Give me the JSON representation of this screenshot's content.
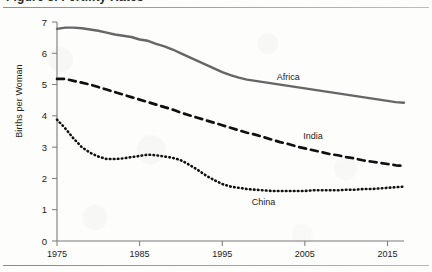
{
  "header": {
    "title_sliver": "Figure 3. Fertility Rates",
    "top_rule": "horizontal-rule",
    "bottom_rule": "horizontal-rule"
  },
  "chart_data": {
    "type": "line",
    "title": "",
    "xlabel": "",
    "ylabel": "Births per Woman",
    "xlim": [
      1975,
      2017
    ],
    "ylim": [
      0,
      7
    ],
    "xticks": [
      1975,
      1985,
      1995,
      2005,
      2015
    ],
    "yticks": [
      0,
      1,
      2,
      3,
      4,
      5,
      6,
      7
    ],
    "grid": false,
    "legend_position": "inline-labels",
    "series": [
      {
        "name": "Africa",
        "style": "solid",
        "color": "#666666",
        "label_x": 2003,
        "label_y": 5.15,
        "x": [
          1975,
          1976,
          1977,
          1978,
          1979,
          1980,
          1981,
          1982,
          1983,
          1984,
          1985,
          1986,
          1987,
          1988,
          1989,
          1990,
          1991,
          1992,
          1993,
          1994,
          1995,
          1996,
          1997,
          1998,
          1999,
          2000,
          2001,
          2002,
          2003,
          2004,
          2005,
          2006,
          2007,
          2008,
          2009,
          2010,
          2011,
          2012,
          2013,
          2014,
          2015,
          2016,
          2017
        ],
        "values": [
          6.78,
          6.82,
          6.82,
          6.8,
          6.76,
          6.72,
          6.66,
          6.6,
          6.56,
          6.52,
          6.44,
          6.4,
          6.3,
          6.22,
          6.12,
          6.0,
          5.88,
          5.76,
          5.64,
          5.52,
          5.4,
          5.3,
          5.22,
          5.16,
          5.12,
          5.08,
          5.04,
          5.0,
          4.96,
          4.92,
          4.88,
          4.84,
          4.8,
          4.76,
          4.72,
          4.68,
          4.64,
          4.6,
          4.56,
          4.52,
          4.48,
          4.44,
          4.42
        ]
      },
      {
        "name": "India",
        "style": "dashed",
        "color": "#101010",
        "label_x": 2006,
        "label_y": 3.25,
        "x": [
          1975,
          1976,
          1977,
          1978,
          1979,
          1980,
          1981,
          1982,
          1983,
          1984,
          1985,
          1986,
          1987,
          1988,
          1989,
          1990,
          1991,
          1992,
          1993,
          1994,
          1995,
          1996,
          1997,
          1998,
          1999,
          2000,
          2001,
          2002,
          2003,
          2004,
          2005,
          2006,
          2007,
          2008,
          2009,
          2010,
          2011,
          2012,
          2013,
          2014,
          2015,
          2016,
          2017
        ],
        "values": [
          5.18,
          5.18,
          5.12,
          5.06,
          5.0,
          4.92,
          4.84,
          4.76,
          4.68,
          4.6,
          4.52,
          4.44,
          4.36,
          4.28,
          4.2,
          4.1,
          4.02,
          3.94,
          3.86,
          3.78,
          3.7,
          3.62,
          3.54,
          3.46,
          3.4,
          3.32,
          3.24,
          3.16,
          3.1,
          3.02,
          2.96,
          2.9,
          2.84,
          2.78,
          2.74,
          2.68,
          2.64,
          2.58,
          2.54,
          2.5,
          2.46,
          2.42,
          2.4
        ]
      },
      {
        "name": "China",
        "style": "dotted",
        "color": "#101010",
        "label_x": 2000,
        "label_y": 1.15,
        "x": [
          1975,
          1976,
          1977,
          1978,
          1979,
          1980,
          1981,
          1982,
          1983,
          1984,
          1985,
          1986,
          1987,
          1988,
          1989,
          1990,
          1991,
          1992,
          1993,
          1994,
          1995,
          1996,
          1997,
          1998,
          1999,
          2000,
          2001,
          2002,
          2003,
          2004,
          2005,
          2006,
          2007,
          2008,
          2009,
          2010,
          2011,
          2012,
          2013,
          2014,
          2015,
          2016,
          2017
        ],
        "values": [
          3.88,
          3.6,
          3.28,
          3.0,
          2.82,
          2.7,
          2.62,
          2.62,
          2.64,
          2.68,
          2.72,
          2.76,
          2.74,
          2.7,
          2.66,
          2.58,
          2.44,
          2.28,
          2.1,
          1.95,
          1.82,
          1.74,
          1.7,
          1.66,
          1.64,
          1.62,
          1.6,
          1.6,
          1.6,
          1.6,
          1.6,
          1.62,
          1.62,
          1.62,
          1.62,
          1.64,
          1.64,
          1.66,
          1.66,
          1.68,
          1.7,
          1.72,
          1.74
        ]
      }
    ]
  }
}
